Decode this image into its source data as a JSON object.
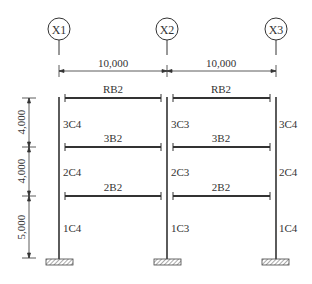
{
  "grid_axes": [
    {
      "label": "X1",
      "x": 59
    },
    {
      "label": "X2",
      "x": 167
    },
    {
      "label": "X3",
      "x": 275
    }
  ],
  "spans": [
    {
      "label": "10,000",
      "from": "X1",
      "to": "X2"
    },
    {
      "label": "10,000",
      "from": "X2",
      "to": "X3"
    }
  ],
  "story_heights": [
    {
      "label": "4,000",
      "level": "roof-to-3"
    },
    {
      "label": "4,000",
      "level": "3-to-2"
    },
    {
      "label": "5,000",
      "level": "2-to-base"
    }
  ],
  "beams": {
    "roof": [
      "RB2",
      "RB2"
    ],
    "level3": [
      "3B2",
      "3B2"
    ],
    "level2": [
      "2B2",
      "2B2"
    ]
  },
  "columns": {
    "story3": [
      "3C4",
      "3C3",
      "3C4"
    ],
    "story2": [
      "2C4",
      "2C3",
      "2C4"
    ],
    "story1": [
      "1C4",
      "1C3",
      "1C4"
    ]
  }
}
